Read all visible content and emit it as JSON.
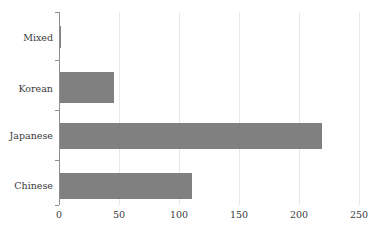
{
  "chart_data": {
    "type": "bar",
    "orientation": "horizontal",
    "title": "",
    "subtitle": "",
    "xlabel": "",
    "ylabel": "",
    "categories": [
      "Chinese",
      "Japanese",
      "Korean",
      "Mixed"
    ],
    "values": [
      111,
      219,
      46,
      2
    ],
    "series": [
      {
        "name": "count",
        "values": [
          111,
          219,
          46,
          2
        ]
      }
    ],
    "xlim": [
      0,
      250
    ],
    "xticks": [
      0,
      50,
      100,
      150,
      200,
      250
    ],
    "xtick_labels": [
      "0",
      "50",
      "100",
      "150",
      "200",
      "250"
    ],
    "ytick_labels_top_to_bottom": [
      "Mixed",
      "Korean",
      "Japanese",
      "Chinese"
    ],
    "grid": "vertical-only",
    "legend": "none",
    "bar_color": "#808080",
    "gridline_color": "#e8e8e8",
    "axis_color": "#8f8f8f",
    "text_color": "#3b3b3b",
    "background_color": "#ffffff"
  },
  "axis": {
    "y_labels": [
      {
        "text": "Mixed"
      },
      {
        "text": "Korean"
      },
      {
        "text": "Japanese"
      },
      {
        "text": "Chinese"
      }
    ],
    "x_labels": [
      {
        "text": "0"
      },
      {
        "text": "50"
      },
      {
        "text": "100"
      },
      {
        "text": "150"
      },
      {
        "text": "200"
      },
      {
        "text": "250"
      }
    ]
  },
  "bars": [
    {
      "category": "Mixed",
      "value": 2
    },
    {
      "category": "Korean",
      "value": 46
    },
    {
      "category": "Japanese",
      "value": 219
    },
    {
      "category": "Chinese",
      "value": 111
    }
  ]
}
